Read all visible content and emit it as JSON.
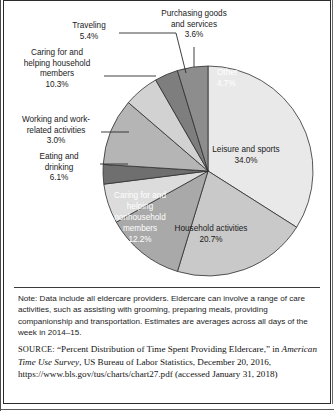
{
  "figure": {
    "note_label": "Note:",
    "note_text": "Data include all eldercare providers. Eldercare can involve a range of care activities, such as assisting with grooming, preparing meals, providing companionship and transportation. Estimates are averages across all days of the week in 2014–15.",
    "source_label": "SOURCE:",
    "source_text_1": "“Percent Distribution of Time Spent Providing Eldercare,” in",
    "source_italic": "American Time Use Survey",
    "source_text_2": ", US Bureau of Labor Statistics, December 20, 2016, https://www.bls.gov/tus/charts/chart27.pdf (accessed January 31, 2018)"
  },
  "chart_data": {
    "type": "pie",
    "title": "",
    "legend": "none",
    "units": "percent",
    "start_angle_deg": 0,
    "direction": "clockwise",
    "categories": [
      "Leisure and sports",
      "Household activities",
      "Caring for and helping nonhousehold members",
      "Eating and drinking",
      "Working and work-related activities",
      "Caring for and helping household members",
      "Traveling",
      "Purchasing goods and services",
      "Other"
    ],
    "values": [
      34.0,
      20.7,
      12.2,
      6.1,
      3.0,
      10.3,
      5.4,
      3.6,
      4.7
    ],
    "colors": [
      "#e9e9e9",
      "#c9c9c9",
      "#a9a9a9",
      "#dcdcdc",
      "#6f6f6f",
      "#b5b5b5",
      "#d2d2d2",
      "#7e7e7e",
      "#8d8d8d"
    ],
    "slices": [
      {
        "label": "Leisure and sports",
        "value": 34.0,
        "value_text": "34.0%",
        "placement": "inside",
        "color": "#e9e9e9"
      },
      {
        "label": "Household activities",
        "value": 20.7,
        "value_text": "20.7%",
        "placement": "inside",
        "color": "#c9c9c9"
      },
      {
        "label": "Caring for and helping nonhousehold members",
        "value": 12.2,
        "value_text": "12.2%",
        "placement": "inside",
        "color": "#a9a9a9"
      },
      {
        "label": "Eating and drinking",
        "value": 6.1,
        "value_text": "6.1%",
        "placement": "outside",
        "color": "#dcdcdc"
      },
      {
        "label": "Working and work-related activities",
        "value": 3.0,
        "value_text": "3.0%",
        "placement": "outside",
        "color": "#6f6f6f"
      },
      {
        "label": "Caring for and helping household members",
        "value": 10.3,
        "value_text": "10.3%",
        "placement": "outside",
        "color": "#b5b5b5"
      },
      {
        "label": "Traveling",
        "value": 5.4,
        "value_text": "5.4%",
        "placement": "outside",
        "color": "#d2d2d2"
      },
      {
        "label": "Purchasing goods and services",
        "value": 3.6,
        "value_text": "3.6%",
        "placement": "outside",
        "color": "#7e7e7e"
      },
      {
        "label": "Other",
        "value": 4.7,
        "value_text": "4.7%",
        "placement": "inside",
        "color": "#8d8d8d"
      }
    ]
  },
  "labels": {
    "purchasing_l1": "Purchasing goods",
    "purchasing_l2": "and services",
    "purchasing_pct": "3.6%",
    "traveling_l1": "Traveling",
    "traveling_pct": "5.4%",
    "caring_hh_l1": "Caring for and",
    "caring_hh_l2": "helping household",
    "caring_hh_l3": "members",
    "caring_hh_pct": "10.3%",
    "working_l1": "Working and work-",
    "working_l2": "related activities",
    "working_pct": "3.0%",
    "eating_l1": "Eating and",
    "eating_l2": "drinking",
    "eating_pct": "6.1%",
    "other_l1": "Other",
    "other_pct": "4.7%",
    "leisure_l1": "Leisure and sports",
    "leisure_pct": "34.0%",
    "household_l1": "Household activities",
    "household_pct": "20.7%",
    "caring_nonhh_l1": "Caring for and",
    "caring_nonhh_l2": "helping",
    "caring_nonhh_l3": "nonhousehold",
    "caring_nonhh_l4": "members",
    "caring_nonhh_pct": "12.2%"
  }
}
